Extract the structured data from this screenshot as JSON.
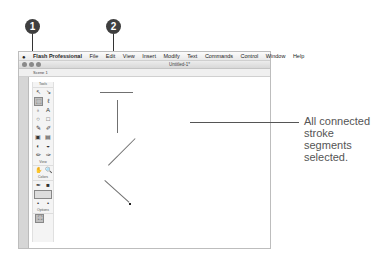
{
  "callouts": [
    {
      "number": "1"
    },
    {
      "number": "2"
    }
  ],
  "menubar": {
    "app": "Flash Professional",
    "items": [
      "File",
      "Edit",
      "View",
      "Insert",
      "Modify",
      "Text",
      "Commands",
      "Control",
      "Window",
      "Help"
    ]
  },
  "window": {
    "title": "Untitled-1*",
    "scene": "Scene 1"
  },
  "tools": {
    "header": "Tools",
    "view_label": "View",
    "colors_label": "Colors",
    "options_label": "Options",
    "row1": [
      "↖",
      "↘"
    ],
    "row2": [
      "⬚",
      "ℓ"
    ],
    "row3": [
      "♁",
      "A"
    ],
    "row4": [
      "○",
      "□"
    ],
    "row5": [
      "✎",
      "✐"
    ],
    "row6": [
      "▣",
      "▤"
    ],
    "row7": [
      "◐",
      "◒"
    ],
    "row8": [
      "✏",
      "✑"
    ],
    "view_row": [
      "✋",
      "🔍"
    ],
    "colors_row1": [
      "✒",
      "■"
    ],
    "options_row": [
      "⛶"
    ]
  },
  "annotation": {
    "line1": "All connected",
    "line2": "stroke segments",
    "line3": "selected."
  }
}
